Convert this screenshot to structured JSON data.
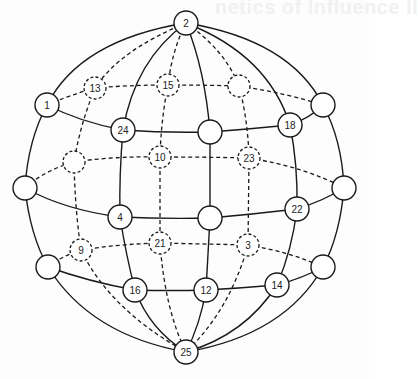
{
  "page": {
    "bleed_through_text": "netics of Influence II"
  },
  "diagram": {
    "nodes": [
      {
        "id": "n2",
        "label": "2",
        "x": 186,
        "y": 23,
        "style": "solid"
      },
      {
        "id": "n25",
        "label": "25",
        "x": 186,
        "y": 352,
        "style": "solid"
      },
      {
        "id": "n1",
        "label": "1",
        "x": 47,
        "y": 105,
        "style": "solid"
      },
      {
        "id": "n13",
        "label": "13",
        "x": 95,
        "y": 88,
        "style": "dashed"
      },
      {
        "id": "n15",
        "label": "15",
        "x": 168,
        "y": 85,
        "style": "dashed"
      },
      {
        "id": "nDTR",
        "label": "",
        "x": 239,
        "y": 86,
        "style": "dashed"
      },
      {
        "id": "nSTR",
        "label": "",
        "x": 323,
        "y": 105,
        "style": "solid"
      },
      {
        "id": "n24",
        "label": "24",
        "x": 123,
        "y": 130,
        "style": "solid"
      },
      {
        "id": "nSCT",
        "label": "",
        "x": 210,
        "y": 132,
        "style": "solid"
      },
      {
        "id": "n18",
        "label": "18",
        "x": 290,
        "y": 125,
        "style": "solid"
      },
      {
        "id": "nDL",
        "label": "",
        "x": 74,
        "y": 162,
        "style": "dashed"
      },
      {
        "id": "n10",
        "label": "10",
        "x": 160,
        "y": 157,
        "style": "dashed"
      },
      {
        "id": "n23",
        "label": "23",
        "x": 249,
        "y": 158,
        "style": "dashed"
      },
      {
        "id": "nSLM",
        "label": "",
        "x": 25,
        "y": 188,
        "style": "solid"
      },
      {
        "id": "nSRM",
        "label": "",
        "x": 344,
        "y": 188,
        "style": "solid"
      },
      {
        "id": "n4",
        "label": "4",
        "x": 120,
        "y": 217,
        "style": "solid"
      },
      {
        "id": "nSC",
        "label": "",
        "x": 210,
        "y": 218,
        "style": "solid"
      },
      {
        "id": "n22",
        "label": "22",
        "x": 297,
        "y": 209,
        "style": "solid"
      },
      {
        "id": "n9",
        "label": "9",
        "x": 81,
        "y": 250,
        "style": "dashed"
      },
      {
        "id": "n21",
        "label": "21",
        "x": 160,
        "y": 243,
        "style": "dashed"
      },
      {
        "id": "n3",
        "label": "3",
        "x": 248,
        "y": 245,
        "style": "dashed"
      },
      {
        "id": "nSLL",
        "label": "",
        "x": 48,
        "y": 267,
        "style": "solid"
      },
      {
        "id": "nSRL",
        "label": "",
        "x": 323,
        "y": 267,
        "style": "solid"
      },
      {
        "id": "n16",
        "label": "16",
        "x": 135,
        "y": 290,
        "style": "solid"
      },
      {
        "id": "n12",
        "label": "12",
        "x": 206,
        "y": 290,
        "style": "solid"
      },
      {
        "id": "n14",
        "label": "14",
        "x": 277,
        "y": 285,
        "style": "solid"
      }
    ]
  }
}
